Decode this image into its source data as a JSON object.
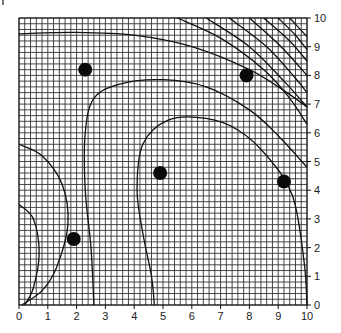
{
  "chart_data": {
    "type": "scatter",
    "title": "",
    "xlabel": "",
    "ylabel": "",
    "xlim": [
      0,
      10
    ],
    "ylim": [
      0,
      10
    ],
    "grid": true,
    "grid_minor_per_unit": 5,
    "x_ticks": [
      "0",
      "1",
      "2",
      "3",
      "4",
      "5",
      "6",
      "7",
      "8",
      "9",
      "10"
    ],
    "y_ticks": [
      "0",
      "1",
      "2",
      "3",
      "4",
      "5",
      "6",
      "7",
      "8",
      "9",
      "10"
    ],
    "y_axis_side": "right",
    "points": [
      {
        "x": 2.3,
        "y": 8.2
      },
      {
        "x": 7.9,
        "y": 8.0
      },
      {
        "x": 4.9,
        "y": 4.6
      },
      {
        "x": 9.2,
        "y": 4.3
      },
      {
        "x": 1.9,
        "y": 2.3
      }
    ],
    "contours": [
      {
        "name": "top-band",
        "points": [
          [
            0,
            9.45
          ],
          [
            2,
            9.5
          ],
          [
            4,
            9.4
          ],
          [
            6,
            9.0
          ],
          [
            8,
            8.2
          ],
          [
            9.3,
            7.4
          ],
          [
            10,
            6.9
          ]
        ]
      },
      {
        "name": "upper-left-loop",
        "points": [
          [
            2.6,
            0
          ],
          [
            2.5,
            2
          ],
          [
            2.3,
            4
          ],
          [
            2.3,
            6.0
          ],
          [
            2.6,
            7.2
          ],
          [
            3.5,
            7.7
          ],
          [
            5,
            7.85
          ],
          [
            6.5,
            7.6
          ],
          [
            8,
            6.8
          ],
          [
            9,
            5.9
          ],
          [
            10,
            4.8
          ]
        ]
      },
      {
        "name": "inner-loop",
        "points": [
          [
            4.7,
            0
          ],
          [
            4.6,
            1
          ],
          [
            4.3,
            2.5
          ],
          [
            4.1,
            4
          ],
          [
            4.3,
            5.6
          ],
          [
            5.2,
            6.45
          ],
          [
            6.5,
            6.5
          ],
          [
            7.6,
            6.1
          ],
          [
            8.6,
            5.2
          ],
          [
            9.5,
            3.8
          ],
          [
            9.9,
            1.5
          ],
          [
            10,
            0
          ]
        ]
      },
      {
        "name": "lower-left-outer",
        "points": [
          [
            0,
            5.6
          ],
          [
            0.8,
            5.2
          ],
          [
            1.5,
            4.2
          ],
          [
            1.7,
            2.8
          ],
          [
            1.3,
            1.3
          ],
          [
            0.8,
            0.5
          ],
          [
            0.1,
            0
          ]
        ]
      },
      {
        "name": "lower-left-inner",
        "points": [
          [
            0,
            3.5
          ],
          [
            0.5,
            3.0
          ],
          [
            0.7,
            1.8
          ],
          [
            0.5,
            0.6
          ],
          [
            0.2,
            0
          ]
        ]
      },
      {
        "name": "arc-1",
        "points": [
          [
            5.5,
            10
          ],
          [
            7,
            9.3
          ],
          [
            8.5,
            8.2
          ],
          [
            9.4,
            7.2
          ],
          [
            10,
            6.3
          ]
        ]
      },
      {
        "name": "arc-2",
        "points": [
          [
            6.5,
            10
          ],
          [
            8,
            9.0
          ],
          [
            9.2,
            7.8
          ],
          [
            10,
            6.9
          ]
        ]
      },
      {
        "name": "arc-3",
        "points": [
          [
            7.3,
            10
          ],
          [
            8.6,
            9.0
          ],
          [
            9.6,
            7.9
          ],
          [
            10,
            7.4
          ]
        ]
      },
      {
        "name": "arc-4",
        "points": [
          [
            8.0,
            10
          ],
          [
            9.1,
            9.0
          ],
          [
            10,
            8.0
          ]
        ]
      },
      {
        "name": "arc-5",
        "points": [
          [
            8.5,
            10
          ],
          [
            9.4,
            9.2
          ],
          [
            10,
            8.5
          ]
        ]
      },
      {
        "name": "arc-6",
        "points": [
          [
            9.0,
            10
          ],
          [
            9.6,
            9.4
          ],
          [
            10,
            8.9
          ]
        ]
      },
      {
        "name": "arc-7",
        "points": [
          [
            9.4,
            10
          ],
          [
            10,
            9.35
          ]
        ]
      }
    ]
  }
}
